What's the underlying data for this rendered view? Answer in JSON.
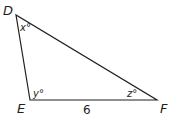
{
  "diagram": {
    "type": "triangle",
    "stroke_color": "#231f20",
    "vertices": {
      "D": {
        "label": "D",
        "x": 16,
        "y": 15
      },
      "E": {
        "label": "E",
        "x": 30,
        "y": 100
      },
      "F": {
        "label": "F",
        "x": 157,
        "y": 100
      }
    },
    "angles": {
      "D": {
        "label": "x°"
      },
      "E": {
        "label": "y°"
      },
      "F": {
        "label": "z°"
      }
    },
    "sides": {
      "EF": {
        "label": "6"
      }
    }
  }
}
